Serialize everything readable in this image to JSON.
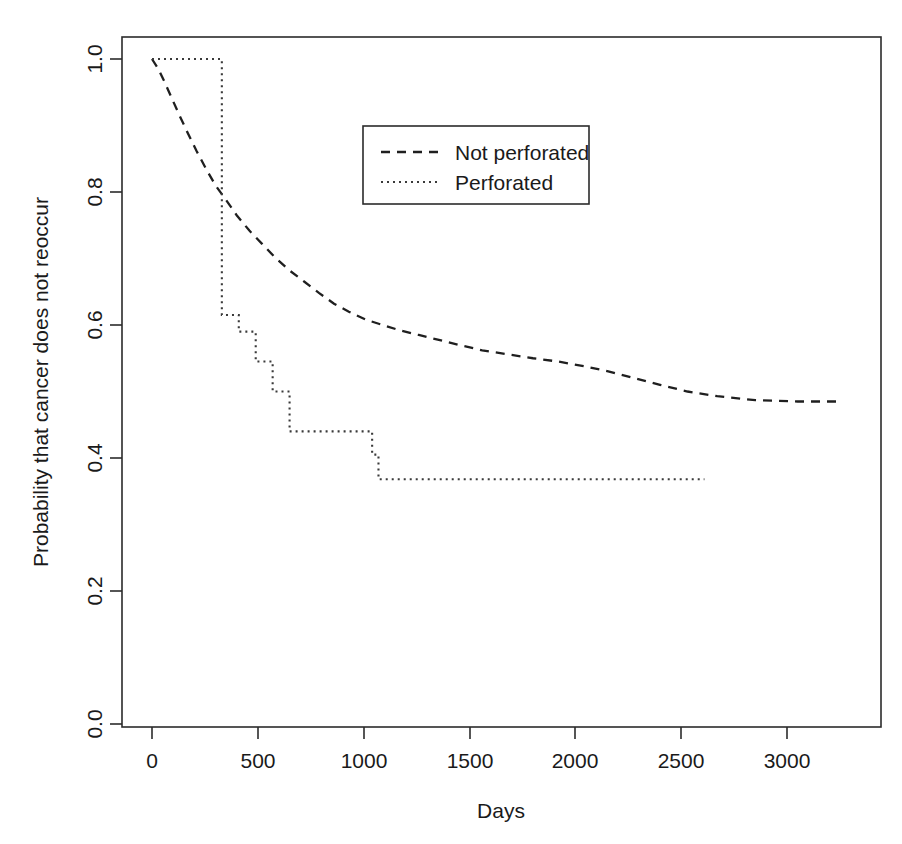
{
  "figure": {
    "kind": "kaplan-meier-survival-plot",
    "background_color": "#ffffff",
    "ink_color": "#1a1a1a"
  },
  "chart_data": {
    "type": "line",
    "title": "",
    "subtitle": "",
    "xlabel": "Days",
    "ylabel": "Probability that cancer does not reoccur",
    "xlim": [
      -120,
      3450
    ],
    "ylim": [
      0.0,
      1.0
    ],
    "xticks": [
      0,
      500,
      1000,
      1500,
      2000,
      2500,
      3000
    ],
    "xticklabels": [
      "0",
      "500",
      "1000",
      "1500",
      "2000",
      "2500",
      "3000"
    ],
    "yticks": [
      0.0,
      0.2,
      0.4,
      0.6,
      0.8,
      1.0
    ],
    "yticklabels": [
      "0.0",
      "0.2",
      "0.4",
      "0.6",
      "0.8",
      "1.0"
    ],
    "grid": false,
    "legend_position": "upper-center-right",
    "legend_entries": [
      "Not perforated",
      "Perforated"
    ],
    "series": [
      {
        "name": "Not perforated",
        "linestyle": "dashed",
        "color": "#1f1f1f",
        "x": [
          0,
          30,
          60,
          95,
          130,
          170,
          210,
          255,
          300,
          350,
          400,
          460,
          520,
          580,
          650,
          720,
          790,
          860,
          930,
          1010,
          1090,
          1170,
          1260,
          1350,
          1450,
          1560,
          1680,
          1800,
          1920,
          2040,
          2160,
          2280,
          2400,
          2530,
          2670,
          2850,
          3050,
          3250
        ],
        "y": [
          1.0,
          0.985,
          0.965,
          0.94,
          0.915,
          0.888,
          0.862,
          0.835,
          0.81,
          0.788,
          0.765,
          0.742,
          0.722,
          0.702,
          0.682,
          0.665,
          0.648,
          0.632,
          0.62,
          0.608,
          0.6,
          0.592,
          0.585,
          0.578,
          0.57,
          0.562,
          0.556,
          0.55,
          0.545,
          0.538,
          0.53,
          0.52,
          0.51,
          0.5,
          0.493,
          0.487,
          0.485,
          0.485
        ]
      },
      {
        "name": "Perforated",
        "linestyle": "dotted",
        "color": "#3a3a3a",
        "step": "post",
        "x": [
          0,
          140,
          150,
          320,
          330,
          400,
          410,
          480,
          490,
          560,
          570,
          640,
          650,
          1030,
          1040,
          1060,
          1070,
          2610
        ],
        "y": [
          1.0,
          1.0,
          1.0,
          1.0,
          0.615,
          0.615,
          0.59,
          0.59,
          0.545,
          0.545,
          0.5,
          0.5,
          0.44,
          0.44,
          0.405,
          0.405,
          0.368,
          0.368
        ]
      }
    ],
    "annotations": []
  },
  "axes": {
    "x_axis_title": "Days",
    "y_axis_title": "Probability that cancer does not reoccur"
  },
  "legend": {
    "items": [
      {
        "label": "Not perforated",
        "style": "dashed"
      },
      {
        "label": "Perforated",
        "style": "dotted"
      }
    ]
  }
}
